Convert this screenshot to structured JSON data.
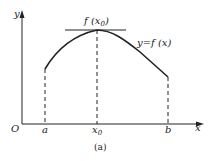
{
  "figure": {
    "caption": "(a)",
    "colors": {
      "stroke": "#222222",
      "background": "#ffffff"
    },
    "axes": {
      "origin_label": "O",
      "x_label": "x",
      "y_label": "y"
    },
    "curve_label": "y=f (x)",
    "max_label": "f (x",
    "max_label_sub": "0",
    "max_label_close": ")",
    "x_ticks": {
      "a": "a",
      "x0": "x",
      "x0_sub": "0",
      "b": "b"
    }
  }
}
